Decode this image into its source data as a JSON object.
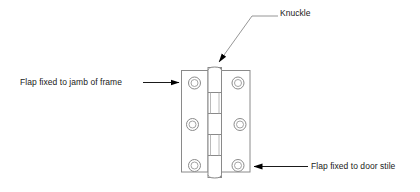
{
  "diagram": {
    "type": "technical-line-drawing",
    "background_color": "#ffffff",
    "line_color": "#808080",
    "text_color": "#1a1a1a",
    "arrow_color": "#000000"
  },
  "labels": {
    "jamb_flap": "Flap fixed to jamb of frame",
    "knuckle": "Knuckle",
    "door_flap": "Flap fixed to door stile"
  },
  "parts": {
    "left_flap": {
      "name": "Flap fixed to jamb of frame",
      "screw_hole_count": 3
    },
    "right_flap": {
      "name": "Flap fixed to door stile",
      "screw_hole_count": 3
    },
    "knuckle": {
      "name": "Knuckle",
      "segment_count": 5
    }
  },
  "leaders": {
    "jamb": {
      "direction": "right",
      "arrow": "arrow-right"
    },
    "knuckle": {
      "direction": "down-left",
      "arrow": "arrow-down-left"
    },
    "stile": {
      "direction": "left",
      "arrow": "arrow-left"
    }
  }
}
